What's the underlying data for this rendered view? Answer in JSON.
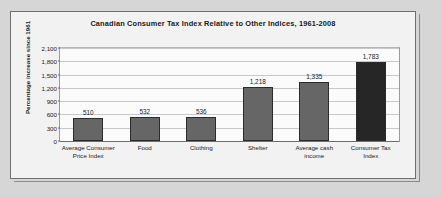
{
  "chart_data": {
    "type": "bar",
    "title": "Canadian Consumer Tax Index Relative to Other Indices, 1961-2008",
    "xlabel": "",
    "ylabel": "Percentage increase since 1961",
    "ylim": [
      0,
      2100
    ],
    "ytick_labels": [
      "2,100",
      "1,800",
      "1,500",
      "1,200",
      "900",
      "600",
      "300",
      "0"
    ],
    "ytick_values": [
      2100,
      1800,
      1500,
      1200,
      900,
      600,
      300,
      0
    ],
    "grid": true,
    "legend": null,
    "categories": [
      "Average Consumer Price Index",
      "Food",
      "Clothing",
      "Shelter",
      "Average cash income",
      "Consumer Tax Index"
    ],
    "values": [
      510,
      532,
      536,
      1218,
      1335,
      1783
    ],
    "value_labels": [
      "510",
      "532",
      "536",
      "1,218",
      "1,335",
      "1,783"
    ],
    "bar_colors": [
      "#666666",
      "#666666",
      "#666666",
      "#666666",
      "#666666",
      "#262626"
    ]
  },
  "colors": {
    "page_background": "#d6d6d6",
    "figure_background": "#f2f2f2",
    "plot_background": "#fbfbfb",
    "frame_border": "#6f6f6f",
    "gridline": "#c9c9c9",
    "bar_default": "#666666",
    "bar_highlight": "#262626",
    "text": "#1a1a1a"
  }
}
